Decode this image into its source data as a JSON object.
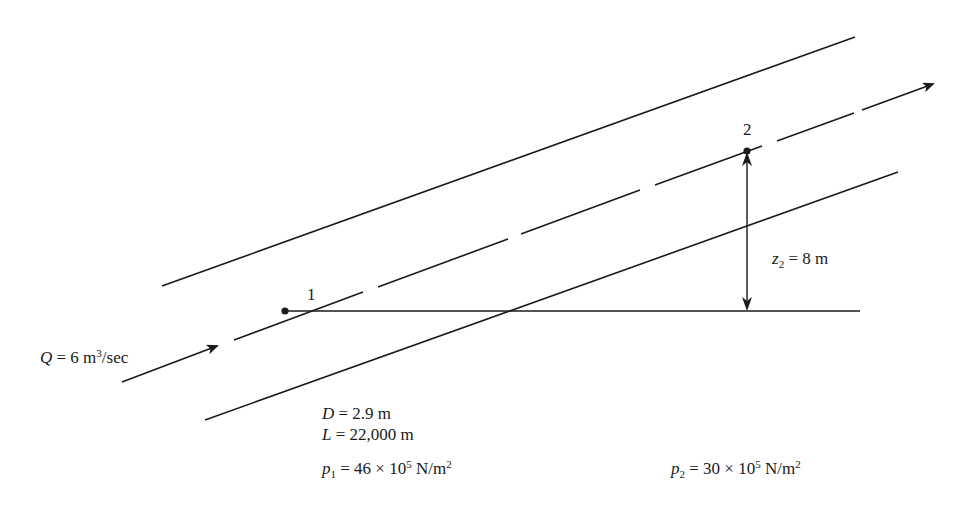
{
  "diagram": {
    "type": "inclined-pipe-flow",
    "colors": {
      "line": "#1a1a1a",
      "background": "#ffffff"
    },
    "flow": {
      "symbol": "Q",
      "equals": " = 6 m",
      "exp": "3",
      "unit": "/sec",
      "value": 6,
      "units": "m^3/sec"
    },
    "points": [
      {
        "id": "1",
        "label": "1"
      },
      {
        "id": "2",
        "label": "2"
      }
    ],
    "elevation": {
      "symbol": "z",
      "subscript": "2",
      "rest": " = 8 m",
      "value": 8,
      "units": "m"
    },
    "pipe": {
      "diameter": {
        "symbol": "D",
        "rest": " = 2.9 m"
      },
      "length": {
        "symbol": "L",
        "rest": " = 22,000 m"
      }
    },
    "pressures": [
      {
        "symbol": "p",
        "subscript": "1",
        "mid": " = 46 × 10",
        "exp": "5",
        "unit": " N/m",
        "unit_exp": "2"
      },
      {
        "symbol": "p",
        "subscript": "2",
        "mid": " = 30 × 10",
        "exp": "5",
        "unit": " N/m",
        "unit_exp": "2"
      }
    ]
  }
}
